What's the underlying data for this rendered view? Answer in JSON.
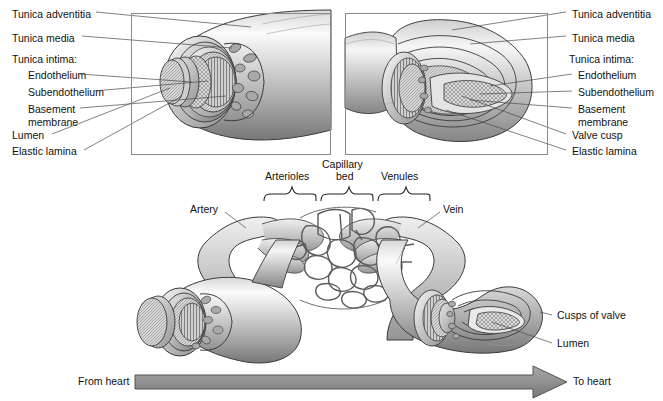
{
  "figure": {
    "panels": {
      "artery": {
        "name": "artery-cutaway"
      },
      "vein": {
        "name": "vein-cutaway"
      }
    }
  },
  "left_labels": [
    {
      "text": "Tunica adventitia",
      "x": 12,
      "y": 14
    },
    {
      "text": "Tunica media",
      "x": 12,
      "y": 38
    },
    {
      "text": "Tunica intima:",
      "x": 12,
      "y": 58
    },
    {
      "text": "Endothelium",
      "x": 28,
      "y": 76
    },
    {
      "text": "Subendothelium",
      "x": 28,
      "y": 93
    },
    {
      "text": "Basement",
      "x": 28,
      "y": 110
    },
    {
      "text": "membrane",
      "x": 28,
      "y": 122
    },
    {
      "text": "Lumen",
      "x": 12,
      "y": 136
    },
    {
      "text": "Elastic lamina",
      "x": 12,
      "y": 152
    }
  ],
  "right_labels": [
    {
      "text": "Tunica adventitia",
      "x": 585,
      "y": 14
    },
    {
      "text": "Tunica media",
      "x": 585,
      "y": 38
    },
    {
      "text": "Tunica intima:",
      "x": 581,
      "y": 58
    },
    {
      "text": "Endothelium",
      "x": 592,
      "y": 76
    },
    {
      "text": "Subendothelium",
      "x": 592,
      "y": 93
    },
    {
      "text": "Basement",
      "x": 592,
      "y": 110
    },
    {
      "text": "membrane",
      "x": 592,
      "y": 122
    },
    {
      "text": "Valve cusp",
      "x": 585,
      "y": 136
    },
    {
      "text": "Elastic lamina",
      "x": 585,
      "y": 152
    }
  ],
  "middle_labels": {
    "arterioles": "Arterioles",
    "capillary_line1": "Capillary",
    "capillary_line2": "bed",
    "venules": "Venules",
    "artery": "Artery",
    "vein": "Vein"
  },
  "bottom_labels": {
    "cusps_of_valve": "Cusps of valve",
    "lumen": "Lumen",
    "from_heart": "From heart",
    "to_heart": "To heart"
  },
  "colors": {
    "arrow_fill": "#8e8e8e",
    "arrow_stroke": "#555555",
    "panel_border": "#8a8a8a",
    "leader_line": "#4a4a4a",
    "text": "#111111",
    "vessel_light": "#f2f2f2",
    "vessel_mid": "#c9c9c9",
    "vessel_dark": "#8c8c8c",
    "vessel_outline": "#3a3a3a"
  },
  "icons": {
    "arrow": "right-arrow-icon",
    "brace": "curly-brace-icon"
  }
}
